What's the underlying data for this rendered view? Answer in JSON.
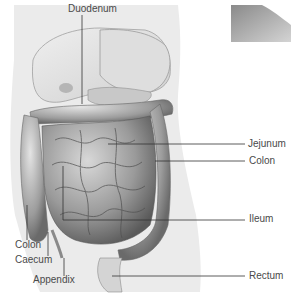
{
  "diagram": {
    "type": "anatomical-illustration",
    "labels": [
      {
        "id": "duodenum",
        "text": "Duodenum",
        "x": 68,
        "y": 4
      },
      {
        "id": "jejunum",
        "text": "Jejunum",
        "x": 248,
        "y": 139
      },
      {
        "id": "colon-right",
        "text": "Colon",
        "x": 249,
        "y": 156
      },
      {
        "id": "ileum",
        "text": "Ileum",
        "x": 249,
        "y": 214
      },
      {
        "id": "colon-left",
        "text": "Colon",
        "x": 15,
        "y": 240
      },
      {
        "id": "caecum",
        "text": "Caecum",
        "x": 15,
        "y": 255
      },
      {
        "id": "appendix",
        "text": "Appendix",
        "x": 33,
        "y": 275
      },
      {
        "id": "rectum",
        "text": "Rectum",
        "x": 249,
        "y": 271
      }
    ],
    "colors": {
      "label_text": "#4a4a4a",
      "leader_line": "#333333",
      "body": "#e9e9e9",
      "organ_light": "#d6d6d6",
      "organ_mid": "#a8a8a8",
      "organ_dark": "#6a6a6a"
    }
  }
}
